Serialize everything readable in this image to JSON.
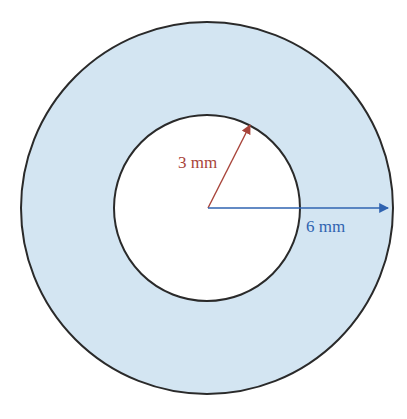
{
  "diagram": {
    "type": "annulus",
    "colors": {
      "background": "#ffffff",
      "ring_fill": "#d3e5f2",
      "outline": "#2a2a2a",
      "inner_radius_color": "#a8443a",
      "outer_radius_color": "#2f63b0"
    },
    "inner_radius": {
      "label": "3 mm",
      "value": 3,
      "unit": "mm"
    },
    "outer_radius": {
      "label": "6 mm",
      "value": 6,
      "unit": "mm"
    }
  }
}
